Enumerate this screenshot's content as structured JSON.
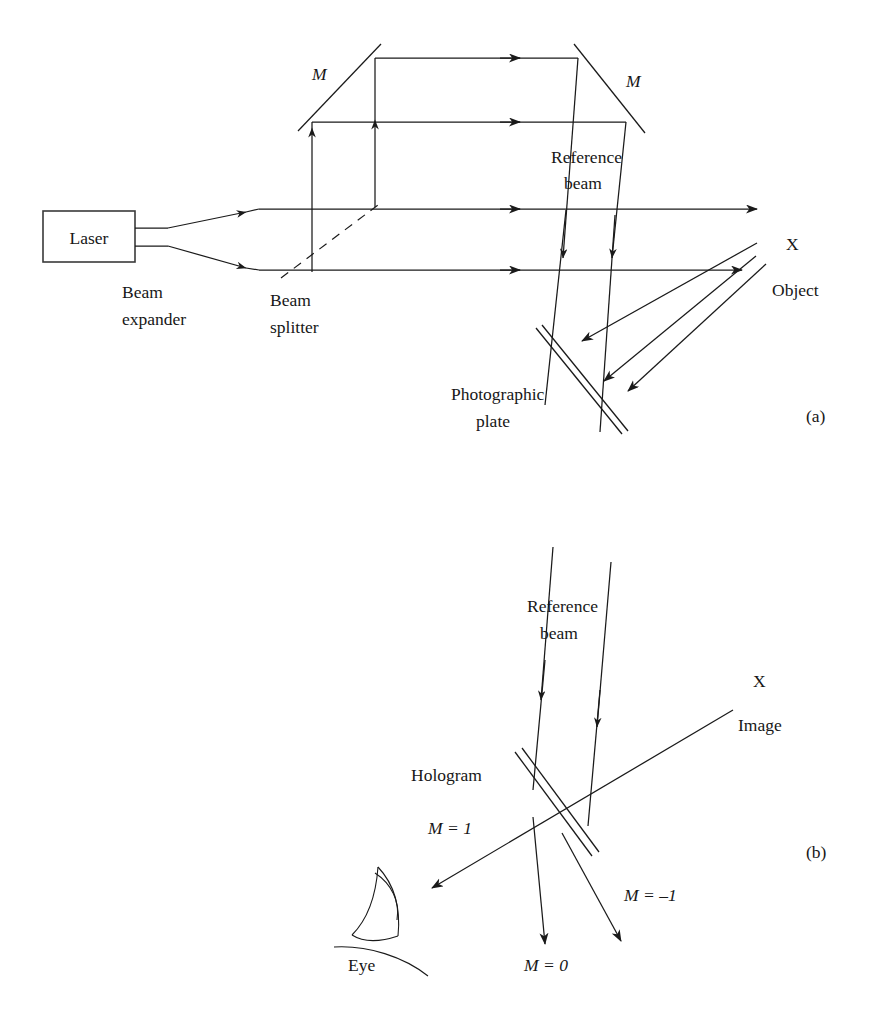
{
  "figure": {
    "type": "optics-diagram",
    "background_color": "#ffffff",
    "line_color": "#1a1a1a"
  },
  "panel_a": {
    "caption": "(a)",
    "labels": {
      "laser": "Laser",
      "beam_expander_line1": "Beam",
      "beam_expander_line2": "expander",
      "beam_splitter_line1": "Beam",
      "beam_splitter_line2": "splitter",
      "mirror_left": "M",
      "mirror_right": "M",
      "reference_beam_line1": "Reference",
      "reference_beam_line2": "beam",
      "photographic_plate_line1": "Photographic",
      "photographic_plate_line2": "plate",
      "object_marker": "X",
      "object": "Object"
    }
  },
  "panel_b": {
    "caption": "(b)",
    "labels": {
      "reference_beam_line1": "Reference",
      "reference_beam_line2": "beam",
      "hologram": "Hologram",
      "image_marker": "X",
      "image": "Image",
      "order_plus_one": "M = 1",
      "order_zero": "M = 0",
      "order_minus_one": "M = –1",
      "eye": "Eye"
    }
  }
}
